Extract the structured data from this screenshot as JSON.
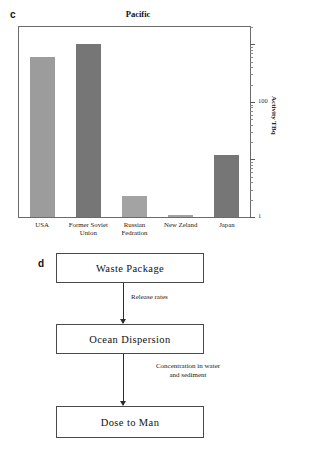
{
  "figure": {
    "panel_c_letter": "c",
    "panel_d_letter": "d"
  },
  "chart_data": {
    "type": "bar",
    "title": "Pacific",
    "xlabel": "",
    "ylabel": "Activity TBq",
    "yscale": "log",
    "ylim": [
      1,
      2000
    ],
    "grid": false,
    "legend": "none",
    "categories": [
      "USA",
      "Former Soviet\nUnion",
      "Russian\nFedration",
      "New Zeland",
      "Japan"
    ],
    "category_labels": [
      {
        "line1": "USA",
        "line2": ""
      },
      {
        "line1": "Former Soviet",
        "line2": "Union"
      },
      {
        "line1": "Russian",
        "line2": "Fedration"
      },
      {
        "line1": "New Zeland",
        "line2": ""
      },
      {
        "line1": "Japan",
        "line2": ""
      }
    ],
    "values": [
      600,
      1000,
      2.3,
      1.1,
      12
    ],
    "bar_colors": [
      "#9c9c9c",
      "#767676",
      "#a3a3a3",
      "#a3a3a3",
      "#767676"
    ],
    "ytick_labels": [
      "100",
      "1"
    ],
    "ytick_values": [
      100,
      1
    ]
  },
  "flowchart": {
    "nodes": [
      {
        "id": "waste-package",
        "label": "Waste Package"
      },
      {
        "id": "ocean-dispersion",
        "label": "Ocean Dispersion"
      },
      {
        "id": "dose-to-man",
        "label": "Dose to Man"
      }
    ],
    "edge_labels": [
      {
        "id": "release-rates",
        "text": "Release rates"
      },
      {
        "id": "concentration",
        "text": "Concentration in water\nand sediment"
      }
    ]
  },
  "colors": {
    "bar_light": "#9c9c9c",
    "bar_lighter": "#a3a3a3",
    "bar_dark": "#767676",
    "frame": "#6b6b6b",
    "box_border": "#4a4a4a",
    "arrow": "#2b2b2b",
    "text": "#1a1a1a",
    "background": "#ffffff"
  }
}
